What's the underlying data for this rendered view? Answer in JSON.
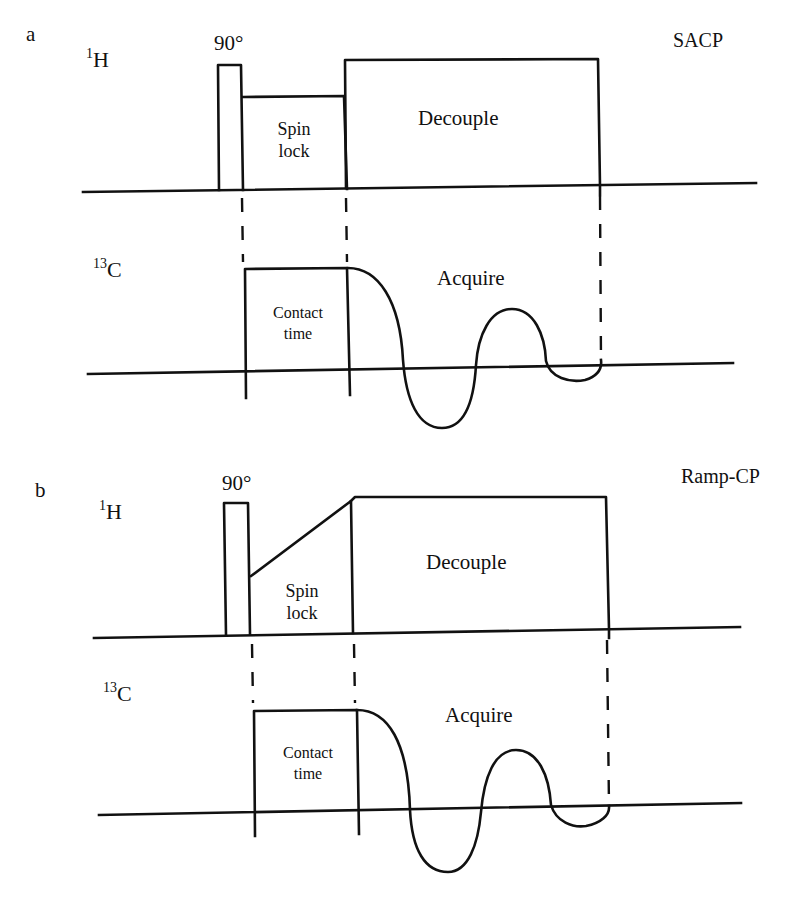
{
  "figure": {
    "panels": [
      {
        "id": "a",
        "letter": "a",
        "sequence_name": "SACP",
        "channels": [
          {
            "nucleus_mass": "1",
            "nucleus_symbol": "H",
            "pulse_label": "90°",
            "blocks": [
              {
                "name": "90° pulse",
                "label": ""
              },
              {
                "name": "spin-lock",
                "label_line1": "Spin",
                "label_line2": "lock",
                "shape": "flat"
              },
              {
                "name": "decouple",
                "label": "Decouple"
              }
            ]
          },
          {
            "nucleus_mass": "13",
            "nucleus_symbol": "C",
            "blocks": [
              {
                "name": "contact-time",
                "label_line1": "Contact",
                "label_line2": "time"
              },
              {
                "name": "acquire",
                "label": "Acquire",
                "shape": "FID"
              }
            ]
          }
        ]
      },
      {
        "id": "b",
        "letter": "b",
        "sequence_name": "Ramp-CP",
        "channels": [
          {
            "nucleus_mass": "1",
            "nucleus_symbol": "H",
            "pulse_label": "90°",
            "blocks": [
              {
                "name": "90° pulse",
                "label": ""
              },
              {
                "name": "spin-lock",
                "label_line1": "Spin",
                "label_line2": "lock",
                "shape": "ramp"
              },
              {
                "name": "decouple",
                "label": "Decouple"
              }
            ]
          },
          {
            "nucleus_mass": "13",
            "nucleus_symbol": "C",
            "blocks": [
              {
                "name": "contact-time",
                "label_line1": "Contact",
                "label_line2": "time"
              },
              {
                "name": "acquire",
                "label": "Acquire",
                "shape": "FID"
              }
            ]
          }
        ]
      }
    ],
    "colors": {
      "line": "#111111",
      "background": "#ffffff"
    }
  }
}
